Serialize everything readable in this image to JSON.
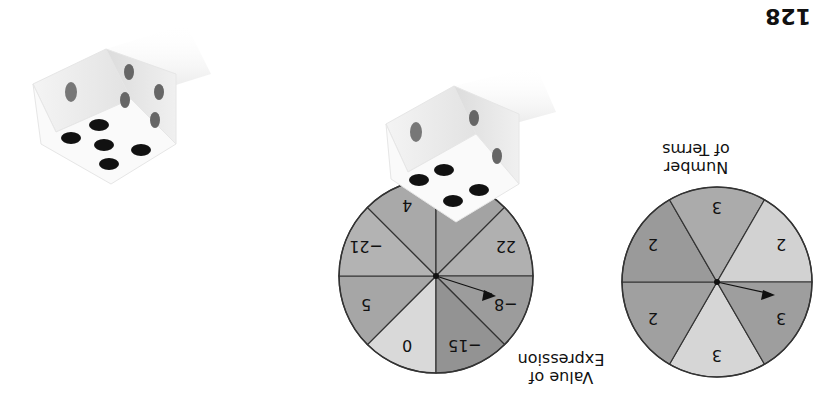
{
  "page": {
    "number": "128",
    "orientation": "rotated 180 degrees"
  },
  "spinner_value": {
    "caption_line1": "Value of",
    "caption_line2": "Expression",
    "sectors": [
      {
        "label": "0",
        "color": "#d9d9d9"
      },
      {
        "label": "5",
        "color": "#a6a6a6"
      },
      {
        "label": "−21",
        "color": "#b3b3b3"
      },
      {
        "label": "4",
        "color": "#a9a9a9"
      },
      {
        "label": "−1",
        "color": "#a3a3a3"
      },
      {
        "label": "22",
        "color": "#b0b0b0"
      },
      {
        "label": "−8",
        "color": "#9c9c9c"
      },
      {
        "label": "−15",
        "color": "#939393"
      }
    ]
  },
  "spinner_terms": {
    "caption_line1": "Number",
    "caption_line2": "of Terms",
    "sectors": [
      {
        "label": "3",
        "color": "#d6d6d6"
      },
      {
        "label": "2",
        "color": "#a0a0a0"
      },
      {
        "label": "2",
        "color": "#9a9a9a"
      },
      {
        "label": "3",
        "color": "#ababab"
      },
      {
        "label": "2",
        "color": "#d2d2d2"
      },
      {
        "label": "3",
        "color": "#9e9e9e"
      }
    ]
  },
  "dice": [
    {
      "top_face": 4,
      "left_face": 1,
      "right_face": 2
    },
    {
      "top_face": 5,
      "left_face": 1,
      "right_face": 4
    }
  ]
}
